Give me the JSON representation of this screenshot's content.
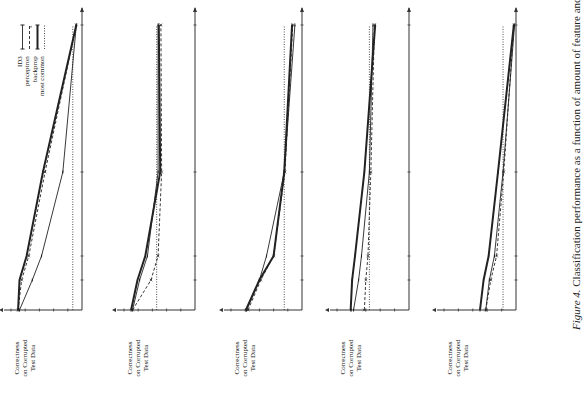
{
  "figure": {
    "caption_prefix": "Figure 4.",
    "caption_text": " Classification performance as a function of amount of feature and category noise."
  },
  "legend": {
    "items": [
      {
        "label": "ID3",
        "style": "thin-with-bar-markers"
      },
      {
        "label": "perceptron",
        "style": "dashed-with-x-markers"
      },
      {
        "label": "backprop",
        "style": "thick-with-bar-markers"
      },
      {
        "label": "most common",
        "style": "dotted"
      }
    ]
  },
  "common": {
    "ylabel_lines": [
      "Correctness",
      "on Corrupted",
      "Test Data"
    ],
    "ytick_labels": [
      "100%",
      "80%",
      "60%",
      "40%",
      "20%"
    ],
    "xtick_labels": [
      "5%",
      "10%",
      "25%",
      "50%"
    ]
  },
  "charts": [
    {
      "title": "Percentage of Feature Values and Categories Changed - Soybeans"
    },
    {
      "title": "Percentage of Feature Values and Categories Changed - Chess"
    },
    {
      "title": "Percentage of Feature Values and Categories Changed - Audiology"
    },
    {
      "title": "Percentage of Feature Values and Categories Changed - Heart Disease"
    },
    {
      "title": "Percentage of Feature Values and Categories Changed - NETtalk256"
    }
  ],
  "chart_data": [
    {
      "type": "line",
      "title": "Percentage of Feature Values and Categories Changed - Soybeans",
      "xlabel": "Percentage of Feature Values and Categories Changed - Soybeans",
      "ylabel": "Correctness on Corrupted Test Data",
      "x": [
        0,
        5,
        10,
        25,
        50
      ],
      "xtick_labels": [
        "5%",
        "10%",
        "25%",
        "50%"
      ],
      "ytick_labels": [
        "20%",
        "40%",
        "60%",
        "80%",
        "100%"
      ],
      "ylim": [
        0,
        100
      ],
      "grid": false,
      "orientation": "rotated 90° counter-clockwise",
      "series": [
        {
          "name": "ID3",
          "values": [
            88,
            70,
            57,
            27,
            8
          ]
        },
        {
          "name": "perceptron",
          "values": [
            90,
            85,
            75,
            52,
            8
          ]
        },
        {
          "name": "backprop",
          "values": [
            90,
            88,
            78,
            55,
            8
          ]
        },
        {
          "name": "most common",
          "values": [
            13,
            13,
            13,
            13,
            13
          ]
        }
      ],
      "legend_position": "top-right"
    },
    {
      "type": "line",
      "title": "Percentage of Feature Values and Categories Changed - Chess",
      "xlabel": "Percentage of Feature Values and Categories Changed - Chess",
      "ylabel": "Correctness on Corrupted Test Data",
      "x": [
        0,
        5,
        10,
        25,
        50
      ],
      "ylim": [
        0,
        100
      ],
      "series": [
        {
          "name": "ID3",
          "values": [
            88,
            78,
            67,
            52,
            52
          ]
        },
        {
          "name": "perceptron",
          "values": [
            88,
            62,
            52,
            47,
            48
          ]
        },
        {
          "name": "backprop",
          "values": [
            90,
            81,
            70,
            49,
            51
          ]
        },
        {
          "name": "most common",
          "values": [
            54,
            54,
            54,
            54,
            54
          ]
        }
      ]
    },
    {
      "type": "line",
      "title": "Percentage of Feature Values and Categories Changed - Audiology",
      "xlabel": "Percentage of Feature Values and Categories Changed - Audiology",
      "ylabel": "Correctness on Corrupted Test Data",
      "x": [
        0,
        5,
        10,
        25,
        50
      ],
      "ylim": [
        0,
        100
      ],
      "series": [
        {
          "name": "ID3",
          "values": [
            78,
            60,
            50,
            25,
            10
          ]
        },
        {
          "name": "perceptron",
          "values": [
            76,
            58,
            40,
            24,
            13
          ]
        },
        {
          "name": "backprop",
          "values": [
            79,
            60,
            40,
            25,
            14
          ]
        },
        {
          "name": "most common",
          "values": [
            25,
            25,
            25,
            25,
            25
          ]
        }
      ]
    },
    {
      "type": "line",
      "title": "Percentage of Feature Values and Categories Changed - Heart Disease",
      "xlabel": "Percentage of Feature Values and Categories Changed - Heart Disease",
      "ylabel": "Correctness on Corrupted Test Data",
      "x": [
        0,
        5,
        10,
        25,
        50
      ],
      "ylim": [
        0,
        100
      ],
      "series": [
        {
          "name": "ID3",
          "values": [
            77,
            70,
            66,
            55,
            50
          ]
        },
        {
          "name": "perceptron",
          "values": [
            62,
            60,
            57,
            53,
            48
          ]
        },
        {
          "name": "backprop",
          "values": [
            81,
            79,
            75,
            62,
            47
          ]
        },
        {
          "name": "most common",
          "values": [
            55,
            55,
            55,
            55,
            55
          ]
        }
      ]
    },
    {
      "type": "line",
      "title": "Percentage of Feature Values and Categories Changed - NETtalk256",
      "xlabel": "Percentage of Feature Values and Categories Changed - NETtalk256",
      "ylabel": "Correctness on Corrupted Test Data",
      "x": [
        0,
        5,
        10,
        25,
        50
      ],
      "ylim": [
        0,
        100
      ],
      "series": [
        {
          "name": "ID3",
          "values": [
            42,
            37,
            30,
            18,
            2
          ]
        },
        {
          "name": "perceptron",
          "values": [
            42,
            35,
            27,
            17,
            3
          ]
        },
        {
          "name": "backprop",
          "values": [
            50,
            45,
            38,
            25,
            3
          ]
        },
        {
          "name": "most common",
          "values": [
            18,
            18,
            18,
            18,
            18
          ]
        }
      ]
    }
  ]
}
